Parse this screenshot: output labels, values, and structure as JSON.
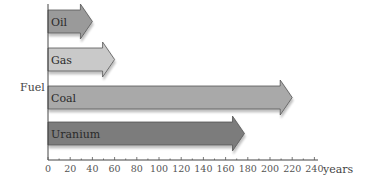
{
  "chart_data": {
    "type": "bar",
    "orientation": "horizontal",
    "style": "arrows",
    "title": "",
    "xlabel": "years",
    "ylabel": "Fuel",
    "xlim": [
      0,
      240
    ],
    "xticks": [
      0,
      20,
      40,
      60,
      80,
      100,
      120,
      140,
      160,
      180,
      200,
      220,
      240
    ],
    "grid": false,
    "legend": null,
    "categories": [
      "Oil",
      "Gas",
      "Coal",
      "Uranium"
    ],
    "values": [
      40,
      60,
      220,
      177
    ],
    "colors": [
      "#9a9a9a",
      "#c9c9c9",
      "#a9a9a9",
      "#7b7b7b"
    ]
  },
  "labels": {
    "y_axis_title": "Fuel",
    "x_axis_title": "years",
    "bars": [
      "Oil",
      "Gas",
      "Coal",
      "Uranium"
    ],
    "ticks": [
      "0",
      "20",
      "40",
      "60",
      "80",
      "100",
      "120",
      "140",
      "160",
      "180",
      "200",
      "220",
      "240"
    ]
  }
}
